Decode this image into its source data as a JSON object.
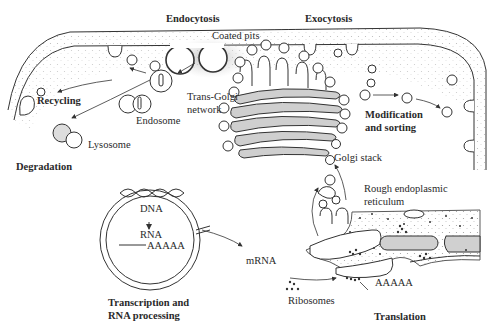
{
  "diagram": {
    "labels": {
      "endocytosis": "Endocytosis",
      "exocytosis": "Exocytosis",
      "coated_pits": "Coated pits",
      "recycling": "Recycling",
      "endosome": "Endosome",
      "lysosome": "Lysosome",
      "degradation": "Degradation",
      "trans_golgi_1": "Trans-Golgi",
      "trans_golgi_2": "network",
      "modification_1": "Modification",
      "modification_2": "and sorting",
      "golgi_stack": "Golgi stack",
      "rer_1": "Rough endoplasmic",
      "rer_2": "reticulum",
      "dna": "DNA",
      "rna": "RNA",
      "polya_nucleus": "AAAAA",
      "mrna": "mRNA",
      "polya_er": "AAAAA",
      "ribosomes": "Ribosomes",
      "transcription_1": "Transcription and",
      "transcription_2": "RNA processing",
      "translation": "Translation"
    },
    "colors": {
      "line": "#333333",
      "shade": "#bdbdbd",
      "background": "#ffffff"
    }
  }
}
